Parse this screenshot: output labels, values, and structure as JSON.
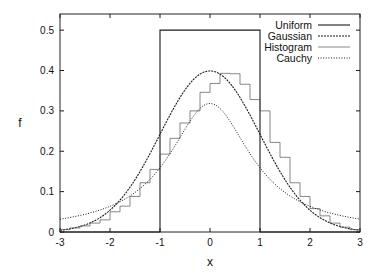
{
  "chart_data": {
    "type": "line",
    "title": "",
    "xlabel": "x",
    "ylabel": "f",
    "xlim": [
      -3,
      3
    ],
    "ylim": [
      0,
      0.54
    ],
    "grid": false,
    "legend_position": "top-right",
    "xticks": [
      -3,
      -2,
      -1,
      0,
      1,
      2,
      3
    ],
    "xtick_labels": [
      "-3",
      "-2",
      "-1",
      "0",
      "1",
      "2",
      "3"
    ],
    "yticks": [
      0,
      0.1,
      0.2,
      0.3,
      0.4,
      0.5
    ],
    "ytick_labels": [
      "0",
      "0.1",
      "0.2",
      "0.3",
      "0.4",
      "0.5"
    ],
    "series": [
      {
        "name": "Uniform",
        "style": "solid",
        "kind": "step",
        "x": [
          -3,
          -1,
          -1,
          1,
          1,
          3
        ],
        "y": [
          0,
          0,
          0.5,
          0.5,
          0,
          0
        ]
      },
      {
        "name": "Gaussian",
        "style": "dashed",
        "kind": "function",
        "formula": "exp(-x^2/2)/sqrt(2*pi)",
        "peak": 0.399
      },
      {
        "name": "Histogram",
        "style": "solid-thin",
        "kind": "histogram",
        "bin_width": 0.2,
        "bin_edges_start": -3,
        "values": [
          0.006,
          0.01,
          0.015,
          0.022,
          0.03,
          0.05,
          0.064,
          0.088,
          0.122,
          0.155,
          0.193,
          0.232,
          0.27,
          0.3,
          0.346,
          0.368,
          0.393,
          0.392,
          0.366,
          0.328,
          0.3,
          0.222,
          0.185,
          0.122,
          0.088,
          0.058,
          0.04,
          0.022,
          0.012,
          0.006
        ]
      },
      {
        "name": "Cauchy",
        "style": "dotted",
        "kind": "function",
        "formula": "1/(pi*(1+x^2))",
        "peak": 0.318
      }
    ]
  },
  "legend": {
    "items": [
      {
        "label": "Uniform",
        "style": "solid"
      },
      {
        "label": "Gaussian",
        "style": "dashed"
      },
      {
        "label": "Histogram",
        "style": "solid-thin"
      },
      {
        "label": "Cauchy",
        "style": "dotted"
      }
    ]
  },
  "axes": {
    "xlabel": "x",
    "ylabel": "f"
  },
  "colors": {
    "line": "#1a1a1a",
    "frame": "#222222",
    "background": "#ffffff"
  }
}
